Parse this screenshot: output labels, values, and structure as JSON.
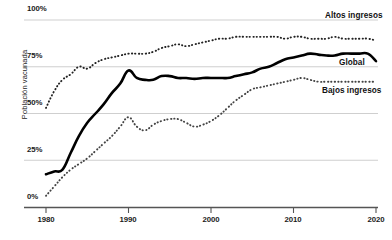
{
  "chart_data": {
    "type": "line",
    "title": "",
    "xlabel": "",
    "ylabel": "Población vacunada",
    "xlim": [
      1980,
      2020
    ],
    "ylim": [
      0,
      100
    ],
    "grid": true,
    "gridlines_y": [
      0,
      25,
      50,
      75,
      100
    ],
    "ytick_labels": [
      "0%",
      "25%",
      "50%",
      "75%",
      "100%"
    ],
    "ytick_values": [
      0,
      25,
      50,
      75,
      100
    ],
    "xtick_labels": [
      "1980",
      "1990",
      "2000",
      "2010",
      "2020"
    ],
    "xtick_values": [
      1980,
      1990,
      2000,
      2010,
      2020
    ],
    "legend_position": "right-inline",
    "x": [
      1980,
      1981,
      1982,
      1983,
      1984,
      1985,
      1986,
      1987,
      1988,
      1989,
      1990,
      1991,
      1992,
      1993,
      1994,
      1995,
      1996,
      1997,
      1998,
      1999,
      2000,
      2001,
      2002,
      2003,
      2004,
      2005,
      2006,
      2007,
      2008,
      2009,
      2010,
      2011,
      2012,
      2013,
      2014,
      2015,
      2016,
      2017,
      2018,
      2019,
      2020
    ],
    "series": [
      {
        "name": "Altos ingresos",
        "style": "dotted",
        "color": "#222222",
        "values": [
          53,
          62,
          68,
          71,
          75,
          74,
          77,
          79,
          80,
          81,
          82,
          82,
          82,
          83,
          85,
          86,
          87,
          86,
          87,
          88,
          89,
          90,
          90,
          91,
          91,
          91,
          91,
          91,
          91,
          90,
          91,
          91,
          90,
          90,
          90,
          91,
          90,
          90,
          90,
          90,
          89
        ]
      },
      {
        "name": "Global",
        "style": "solid",
        "color": "#000000",
        "values": [
          17.5,
          19,
          20,
          29,
          38,
          45,
          50,
          55,
          61,
          66,
          73,
          69,
          68,
          68,
          70,
          70,
          69,
          69,
          68.5,
          69,
          69,
          69,
          69,
          70,
          71,
          72,
          74,
          75,
          77,
          79,
          80,
          81,
          82,
          81.5,
          81,
          81,
          82,
          82,
          82,
          82,
          78
        ]
      },
      {
        "name": "Bajos ingresos",
        "style": "dotted",
        "color": "#444444",
        "values": [
          6,
          11,
          16,
          20,
          23,
          26,
          30,
          34,
          38,
          43,
          48,
          43,
          41,
          44,
          46,
          47,
          47,
          45,
          43,
          44,
          46,
          49,
          53,
          57,
          60,
          63,
          64,
          65,
          66,
          67,
          68,
          69,
          68,
          67,
          67,
          67,
          67,
          67,
          67,
          67,
          67
        ]
      }
    ]
  },
  "labels": {
    "altos_ingresos": "Altos ingresos",
    "global": "Global",
    "bajos_ingresos": "Bajos ingresos"
  }
}
